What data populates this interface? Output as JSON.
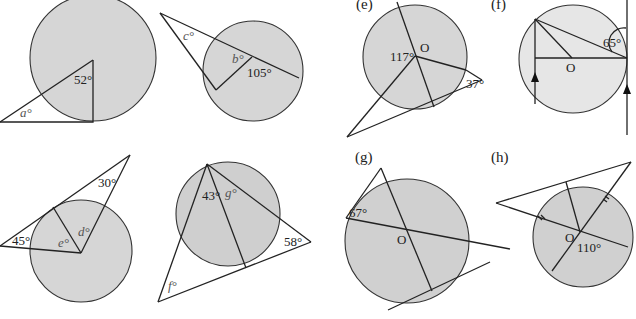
{
  "colors": {
    "circle_fill": "#d6d6d6",
    "circle_fill_dark": "#cfcfcf",
    "line": "#222222",
    "background": "#ffffff"
  },
  "panels": {
    "a": {
      "label": "",
      "angles": [
        "52°",
        "a°"
      ]
    },
    "b": {
      "label": "",
      "angles": [
        "c°",
        "b°",
        "105°"
      ]
    },
    "c": {
      "label": "",
      "angles": [
        "30°",
        "45°",
        "e°",
        "d°"
      ]
    },
    "d": {
      "label": "",
      "angles": [
        "43°",
        "g°",
        "58°",
        "f°"
      ]
    },
    "e": {
      "label": "(e)",
      "angles": [
        "117°",
        "37°"
      ],
      "center": "O"
    },
    "f": {
      "label": "(f)",
      "angles": [
        "65°"
      ],
      "center": "O"
    },
    "g": {
      "label": "(g)",
      "angles": [
        "67°"
      ],
      "center": "O"
    },
    "h": {
      "label": "(h)",
      "angles": [
        "110°"
      ],
      "center": "O"
    }
  }
}
